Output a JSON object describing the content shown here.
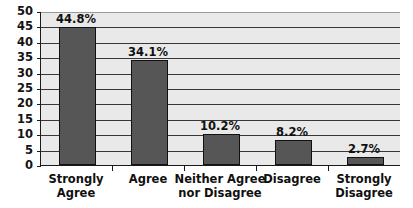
{
  "chart_data": {
    "type": "bar",
    "title": "",
    "subtitle": "",
    "xlabel": "",
    "ylabel": "",
    "categories": [
      "Strongly Agree",
      "Agree",
      "Neither Agree nor Disagree",
      "Disagree",
      "Strongly Disagree"
    ],
    "category_lines": [
      [
        "Strongly",
        "Agree"
      ],
      [
        "Agree",
        ""
      ],
      [
        "Neither Agree",
        "nor Disagree"
      ],
      [
        "Disagree",
        ""
      ],
      [
        "Strongly",
        "Disagree"
      ]
    ],
    "values": [
      44.8,
      34.1,
      10.2,
      8.2,
      2.7
    ],
    "data_labels": [
      "44.8%",
      "34.1%",
      "10.2%",
      "8.2%",
      "2.7%"
    ],
    "ylim": [
      0,
      50
    ],
    "ytick_values": [
      0,
      5,
      10,
      15,
      20,
      25,
      30,
      35,
      40,
      45,
      50
    ],
    "ytick_labels": [
      "0",
      "5",
      "10",
      "15",
      "20",
      "25",
      "30",
      "35",
      "40",
      "45",
      "50"
    ],
    "grid": true,
    "legend": false,
    "legend_position": "none",
    "colors": {
      "bar_fill": "#565656",
      "bar_border": "#111111",
      "plot_background": "#e9e9e9",
      "gridline": "#37373a",
      "axis": "#1a1a1a",
      "text": "#101010",
      "page_background": "#ffffff"
    }
  }
}
